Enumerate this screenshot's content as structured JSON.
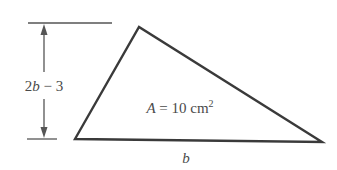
{
  "diagram": {
    "type": "triangle-area-problem",
    "height_label": {
      "parts": [
        "2",
        "b",
        " − 3"
      ],
      "text": "2b − 3"
    },
    "base_label": "b",
    "area_label": {
      "prefix": "A",
      "equals": " = 10 cm",
      "superscript": "2",
      "text": "A = 10 cm²"
    },
    "colors": {
      "line": "#3a3a3a",
      "dimension": "#555555",
      "text": "#4a4a4a",
      "background": "#ffffff"
    }
  }
}
